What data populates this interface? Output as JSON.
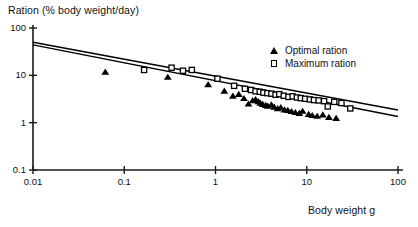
{
  "chart_data": {
    "type": "scatter",
    "title": "",
    "ylabel": "Ration (% body weight/day)",
    "xlabel": "Body weight g",
    "xscale": "log",
    "yscale": "log",
    "xlim": [
      0.01,
      100
    ],
    "ylim": [
      0.1,
      100
    ],
    "grid": false,
    "xticks": [
      "0.01",
      "0.1",
      "1",
      "10",
      "100"
    ],
    "xtick_values": [
      0.01,
      0.1,
      1,
      10,
      100
    ],
    "yticks": [
      "0.1",
      "1",
      "10",
      "100"
    ],
    "ytick_values": [
      0.1,
      1,
      10,
      100
    ],
    "legend_position": "top-right",
    "series": [
      {
        "name": "Optimal ration",
        "marker": "filled-triangle",
        "color": "#000000",
        "points": [
          [
            0.062,
            11.5
          ],
          [
            0.3,
            9.0
          ],
          [
            0.83,
            6.3
          ],
          [
            1.25,
            4.6
          ],
          [
            1.55,
            3.6
          ],
          [
            1.8,
            3.9
          ],
          [
            2.05,
            3.2
          ],
          [
            2.3,
            2.45
          ],
          [
            2.55,
            2.9
          ],
          [
            2.75,
            3.05
          ],
          [
            2.95,
            2.75
          ],
          [
            3.1,
            2.55
          ],
          [
            3.3,
            2.4
          ],
          [
            3.55,
            2.3
          ],
          [
            3.75,
            2.2
          ],
          [
            4.1,
            2.35
          ],
          [
            4.4,
            2.1
          ],
          [
            4.8,
            1.95
          ],
          [
            5.2,
            2.05
          ],
          [
            5.7,
            1.85
          ],
          [
            6.2,
            1.8
          ],
          [
            6.8,
            1.7
          ],
          [
            7.5,
            1.62
          ],
          [
            8.3,
            1.55
          ],
          [
            9.0,
            1.72
          ],
          [
            10.5,
            1.48
          ],
          [
            11.5,
            1.4
          ],
          [
            13.0,
            1.35
          ],
          [
            15.0,
            1.45
          ],
          [
            17.5,
            1.28
          ],
          [
            21.0,
            1.22
          ]
        ]
      },
      {
        "name": "Maximum ration",
        "marker": "open-square",
        "color": "#000000",
        "points": [
          [
            0.165,
            13.0
          ],
          [
            0.33,
            14.5
          ],
          [
            0.44,
            12.5
          ],
          [
            0.55,
            13.0
          ],
          [
            1.05,
            8.5
          ],
          [
            1.6,
            6.0
          ],
          [
            2.1,
            5.2
          ],
          [
            2.45,
            4.9
          ],
          [
            2.75,
            4.6
          ],
          [
            3.05,
            4.5
          ],
          [
            3.35,
            4.3
          ],
          [
            3.7,
            4.2
          ],
          [
            4.1,
            4.1
          ],
          [
            4.55,
            3.9
          ],
          [
            5.0,
            4.0
          ],
          [
            5.6,
            3.7
          ],
          [
            6.3,
            3.5
          ],
          [
            7.0,
            3.6
          ],
          [
            7.8,
            3.4
          ],
          [
            8.6,
            3.3
          ],
          [
            9.6,
            3.2
          ],
          [
            10.8,
            3.1
          ],
          [
            12.0,
            3.0
          ],
          [
            13.5,
            2.95
          ],
          [
            15.5,
            2.85
          ],
          [
            17.0,
            2.2
          ],
          [
            20.0,
            2.75
          ],
          [
            24.0,
            2.6
          ],
          [
            30.0,
            2.0
          ]
        ]
      }
    ],
    "fit_lines": [
      {
        "name": "maximum-ration-fit",
        "x_start": 0.01,
        "y_start": 50.0,
        "x_end": 100.0,
        "y_end": 1.85
      },
      {
        "name": "optimal-ration-fit",
        "x_start": 0.01,
        "y_start": 44.0,
        "x_end": 100.0,
        "y_end": 1.35
      }
    ]
  },
  "legend": {
    "items": [
      {
        "label": "Optimal ration",
        "marker": "filled-triangle"
      },
      {
        "label": "Maximum ration",
        "marker": "open-square"
      }
    ]
  }
}
